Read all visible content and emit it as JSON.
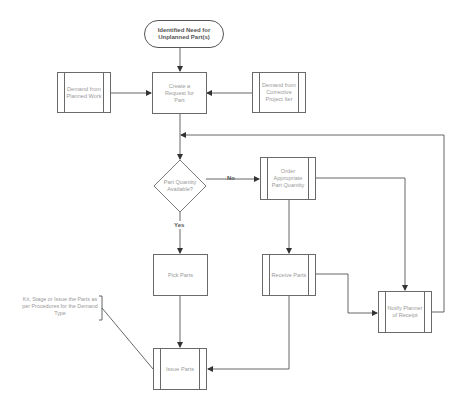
{
  "diagram": {
    "type": "flowchart",
    "start": {
      "label": "Identified Need for Unplanned Part(s)"
    },
    "nodes": {
      "demand_planned": {
        "label": "Demand from Planned Work",
        "shape": "predefined-process"
      },
      "create_request": {
        "label": "Create a Request for Part",
        "shape": "process"
      },
      "demand_corrective": {
        "label": "Demand from Corrective Project Iter",
        "shape": "predefined-process"
      },
      "decision": {
        "label": "Part Quantity Available?",
        "shape": "decision"
      },
      "order_parts": {
        "label": "Order Appropriate Part Quantity",
        "shape": "predefined-process"
      },
      "pick_parts": {
        "label": "Pick Parts",
        "shape": "process"
      },
      "receive_parts": {
        "label": "Receive Parts",
        "shape": "predefined-process"
      },
      "notify_planner": {
        "label": "Notify Planner of Receipt",
        "shape": "predefined-process"
      },
      "issue_parts": {
        "label": "Issue Parts",
        "shape": "predefined-process"
      }
    },
    "edge_labels": {
      "no": "No",
      "yes": "Yes"
    },
    "annotation": {
      "label": "Kit, Stage or Issue the Parts as per Procedures for the Demand Type"
    },
    "edges": [
      [
        "start",
        "create_request"
      ],
      [
        "demand_planned",
        "create_request"
      ],
      [
        "demand_corrective",
        "create_request"
      ],
      [
        "create_request",
        "decision"
      ],
      [
        "decision",
        "order_parts",
        "No"
      ],
      [
        "decision",
        "pick_parts",
        "Yes"
      ],
      [
        "order_parts",
        "receive_parts"
      ],
      [
        "order_parts",
        "notify_planner"
      ],
      [
        "receive_parts",
        "notify_planner"
      ],
      [
        "receive_parts",
        "issue_parts"
      ],
      [
        "pick_parts",
        "issue_parts"
      ],
      [
        "notify_planner",
        "decision"
      ]
    ],
    "colors": {
      "line": "#555555",
      "node_border": "#6a6a6a",
      "node_text": "#9a9a9a",
      "background": "#ffffff"
    }
  }
}
